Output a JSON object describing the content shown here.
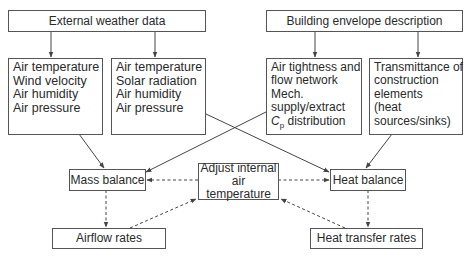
{
  "diagram": {
    "top_boxes": {
      "weather": "External weather data",
      "envelope": "Building envelope description"
    },
    "input_boxes": {
      "weather_a": [
        "Air temperature",
        "Wind velocity",
        "Air humidity",
        "Air pressure"
      ],
      "weather_b": [
        "Air temperature",
        "Solar radiation",
        "Air humidity",
        "Air pressure"
      ],
      "envelope_a": {
        "lines": [
          "Air tightness and",
          "flow network",
          "Mech.",
          "supply/extract"
        ],
        "cp_symbol": "C",
        "cp_subscript": "p",
        "cp_suffix": " distribution"
      },
      "envelope_b": [
        "Transmittance of",
        "construction",
        "elements",
        "(heat",
        "sources/sinks)"
      ]
    },
    "process_boxes": {
      "mass_balance": "Mass balance",
      "adjust_temp_line1": "Adjust internal",
      "adjust_temp_line2": "air temperature",
      "heat_balance": "Heat balance"
    },
    "output_boxes": {
      "airflow": "Airflow rates",
      "heat_transfer": "Heat transfer rates"
    },
    "colors": {
      "line": "#444444",
      "text": "#2a2a2a",
      "background": "#ffffff"
    }
  }
}
